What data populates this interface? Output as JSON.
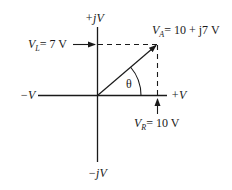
{
  "diagram": {
    "type": "phasor",
    "axes": {
      "positive_real": "+V",
      "negative_real": "−V",
      "positive_imag": "+jV",
      "negative_imag": "−jV"
    },
    "phasor": {
      "symbol": "V",
      "subscript": "A",
      "expression": "= 10 + j7  V"
    },
    "components": {
      "inductive": {
        "symbol": "V",
        "subscript": "L",
        "expression": "= 7  V"
      },
      "resistive": {
        "symbol": "V",
        "subscript": "R",
        "expression": "= 10  V"
      }
    },
    "angle_label": "θ",
    "colors": {
      "line": "#1a1a1a",
      "background": "#ffffff"
    }
  }
}
